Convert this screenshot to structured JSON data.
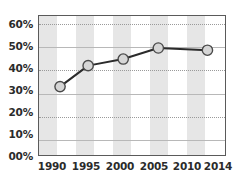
{
  "chart_data": {
    "type": "line",
    "title": "",
    "subtitle": "",
    "xlabel": "",
    "ylabel": "",
    "xlim": [
      1989,
      2015.5
    ],
    "ylim": [
      0,
      63
    ],
    "grid": true,
    "legend": null,
    "x_tick_labels": [
      "1990",
      "1995",
      "2000",
      "2005",
      "2010",
      "2014"
    ],
    "x_tick_values": [
      1990,
      1995,
      2000,
      2005,
      2010,
      2014
    ],
    "y_tick_labels": [
      "00%",
      "10%",
      "20%",
      "30%",
      "40%",
      "50%",
      "60%"
    ],
    "y_tick_values": [
      0,
      10,
      20,
      30,
      40,
      50,
      60
    ],
    "series": [
      {
        "name": "series-1",
        "x": [
          1992,
          1996,
          2001,
          2006,
          2013
        ],
        "values": [
          31,
          40.5,
          43.5,
          48.5,
          47.5
        ],
        "line_color": "#2b2b2b",
        "marker_fill": "#d6d6d6",
        "marker_edge": "#4a4a4a"
      }
    ],
    "bands": [
      {
        "from": 1989.0,
        "to": 1991.6
      },
      {
        "from": 1994.2,
        "to": 1996.8
      },
      {
        "from": 1999.4,
        "to": 2002.0
      },
      {
        "from": 2004.6,
        "to": 2007.2
      },
      {
        "from": 2009.8,
        "to": 2012.4
      }
    ],
    "band_color": "#e6e6e6",
    "plot_border_color": "#5a5a5a",
    "gridline_color": "#9a9a9a",
    "background_color": "#ffffff",
    "text_color": "#2b2b2b"
  }
}
